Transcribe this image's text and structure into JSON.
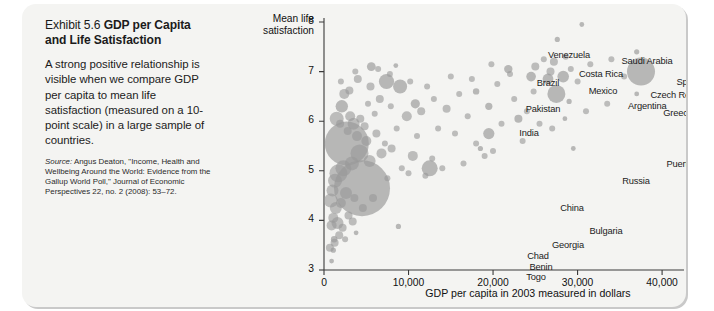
{
  "exhibit": {
    "title_lead": "Exhibit 5.6 ",
    "title_bold": "GDP per Capita and Life Satisfaction",
    "body": "A strong positive relationship is visible when we compare GDP per capita to mean life satisfaction (measured on a 10-point scale) in a large sample of countries.",
    "source_label": "Source:",
    "source_text": "Angus Deaton, \"Income, Health and Wellbeing Around the World: Evidence from the Gallup World Poll,\" Journal of Economic Perspectives 22, no. 2 (2008): 53–72."
  },
  "colors": {
    "card_background": "#f4f4f2",
    "bubble_fill": "#9a9a9a",
    "axis": "#3a3a3a",
    "text": "#1b1b1b"
  },
  "chart_data": {
    "type": "scatter",
    "title": "GDP per Capita and Life Satisfaction",
    "xlabel": "GDP per capita in 2003 measured in dollars",
    "ylabel": "Mean life satisfaction",
    "ylabel_line1": "Mean life",
    "ylabel_line2": "satisfaction",
    "xlim": [
      0,
      42000
    ],
    "ylim": [
      3,
      8
    ],
    "xticks": [
      0,
      10000,
      20000,
      30000,
      40000
    ],
    "xticklabels": [
      "0",
      "10,000",
      "20,000",
      "30,000",
      "40,000"
    ],
    "yticks": [
      3,
      4,
      5,
      6,
      7,
      8
    ],
    "yticklabels": [
      "3",
      "4",
      "5",
      "6",
      "7",
      "8"
    ],
    "grid": false,
    "legend": "none",
    "size_encoding": "population",
    "points": [
      {
        "name": "Denmark",
        "x": 30500,
        "y": 7.95,
        "r": 2.4,
        "lx": 556,
        "ly": 12,
        "anchor": "left"
      },
      {
        "name": "Finland",
        "x": 27600,
        "y": 7.65,
        "r": 2.6,
        "lx": 509,
        "ly": 24,
        "anchor": "center"
      },
      {
        "name": "Norway",
        "x": 37000,
        "y": 7.4,
        "r": 2.6,
        "lx": 600,
        "ly": 42,
        "anchor": "center"
      },
      {
        "name": "Venezuela",
        "x": 5600,
        "y": 7.1,
        "r": 4.4,
        "lx": 351,
        "ly": 46,
        "anchor": "center"
      },
      {
        "name": "Saudi Arabia",
        "x": 21800,
        "y": 7.05,
        "r": 4.2,
        "lx": 429,
        "ly": 52,
        "anchor": "center"
      },
      {
        "name": "Costa Rica",
        "x": 8500,
        "y": 7.12,
        "r": 2.4,
        "lx": 383,
        "ly": 65,
        "anchor": "center"
      },
      {
        "name": "Brazil",
        "x": 7400,
        "y": 6.8,
        "r": 7.6,
        "lx": 330,
        "ly": 74,
        "anchor": "center"
      },
      {
        "name": "USA",
        "x": 37500,
        "y": 7.0,
        "r": 14.0,
        "lx": 634,
        "ly": 66,
        "anchor": "left"
      },
      {
        "name": "Spain",
        "x": 24500,
        "y": 6.9,
        "r": 4.8,
        "lx": 470,
        "ly": 73,
        "anchor": "center"
      },
      {
        "name": "Italy",
        "x": 26500,
        "y": 6.85,
        "r": 5.4,
        "lx": 505,
        "ly": 66,
        "anchor": "center"
      },
      {
        "name": "UK",
        "x": 28300,
        "y": 6.9,
        "r": 5.8,
        "lx": 540,
        "ly": 79,
        "anchor": "center"
      },
      {
        "name": "Mexico",
        "x": 9000,
        "y": 6.7,
        "r": 7.0,
        "lx": 385,
        "ly": 82,
        "anchor": "center"
      },
      {
        "name": "Czech Rep.",
        "x": 18000,
        "y": 6.6,
        "r": 3.2,
        "lx": 456,
        "ly": 86,
        "anchor": "center"
      },
      {
        "name": "Japan",
        "x": 27500,
        "y": 6.55,
        "r": 9.0,
        "lx": 518,
        "ly": 95,
        "anchor": "center"
      },
      {
        "name": "Singapore",
        "x": 29000,
        "y": 6.4,
        "r": 2.6,
        "lx": 563,
        "ly": 101,
        "anchor": "center"
      },
      {
        "name": "Pakistan",
        "x": 2100,
        "y": 6.3,
        "r": 6.2,
        "lx": 325,
        "ly": 100,
        "anchor": "center"
      },
      {
        "name": "Argentina",
        "x": 10800,
        "y": 6.35,
        "r": 4.6,
        "lx": 410,
        "ly": 97,
        "anchor": "left"
      },
      {
        "name": "Greece",
        "x": 19500,
        "y": 6.3,
        "r": 3.6,
        "lx": 460,
        "ly": 104,
        "anchor": "center"
      },
      {
        "name": "Emirates",
        "x": 37000,
        "y": 6.55,
        "r": 2.4,
        "lx": 634,
        "ly": 95,
        "anchor": "center"
      },
      {
        "name": "India",
        "x": 2700,
        "y": 5.55,
        "r": 22.0,
        "lx": 311,
        "ly": 124,
        "anchor": "center"
      },
      {
        "name": "Taiwan",
        "x": 23000,
        "y": 6.05,
        "r": 4.0,
        "lx": 488,
        "ly": 117,
        "anchor": "center"
      },
      {
        "name": "Kuwait",
        "x": 28500,
        "y": 6.05,
        "r": 2.4,
        "lx": 540,
        "ly": 120,
        "anchor": "center"
      },
      {
        "name": "Korea",
        "x": 19500,
        "y": 5.75,
        "r": 5.6,
        "lx": 481,
        "ly": 137,
        "anchor": "center"
      },
      {
        "name": "Puerto Rico",
        "x": 18500,
        "y": 5.45,
        "r": 2.6,
        "lx": 472,
        "ly": 155,
        "anchor": "center"
      },
      {
        "name": "Hong Kong",
        "x": 29500,
        "y": 5.45,
        "r": 2.4,
        "lx": 557,
        "ly": 155,
        "anchor": "center"
      },
      {
        "name": "Russia",
        "x": 12500,
        "y": 5.05,
        "r": 8.0,
        "lx": 418,
        "ly": 172,
        "anchor": "center"
      },
      {
        "name": "China",
        "x": 4500,
        "y": 4.65,
        "r": 28.0,
        "lx": 354,
        "ly": 199,
        "anchor": "center"
      },
      {
        "name": "Bulgaria",
        "x": 8800,
        "y": 3.88,
        "r": 2.6,
        "lx": 388,
        "ly": 222,
        "anchor": "center"
      },
      {
        "name": "Georgia",
        "x": 3800,
        "y": 3.75,
        "r": 2.4,
        "lx": 350,
        "ly": 236,
        "anchor": "center"
      },
      {
        "name": "Chad",
        "x": 1200,
        "y": 3.62,
        "r": 3.2,
        "lx": 320,
        "ly": 247,
        "anchor": "center"
      },
      {
        "name": "Benin",
        "x": 1100,
        "y": 3.4,
        "r": 2.6,
        "lx": 323,
        "ly": 258,
        "anchor": "center"
      },
      {
        "name": "Togo",
        "x": 900,
        "y": 3.18,
        "r": 2.4,
        "lx": 318,
        "ly": 268,
        "anchor": "center"
      }
    ]
  }
}
